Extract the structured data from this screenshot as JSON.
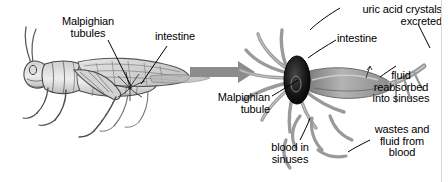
{
  "figure": {
    "background_color": "#ffffff",
    "text_color": "#000000",
    "ink_color": "#4a4a4a",
    "arrow_color": "#8c8c8c",
    "tubule_color": "#9a9a9a",
    "gut_color": "#1c1c1c"
  },
  "left_panel": {
    "name": "grasshopper-whole-body",
    "labels": [
      {
        "id": "malpighian-tubules",
        "text": "Malpighian\ntubules",
        "align": "center"
      },
      {
        "id": "intestine",
        "text": "intestine",
        "align": "left"
      }
    ]
  },
  "transition": {
    "name": "magnification-arrow",
    "direction": "right"
  },
  "right_panel": {
    "name": "malpighian-tubule-detail",
    "labels": [
      {
        "id": "uric-acid-crystals-excreted",
        "text": "uric acid crystals\nexcreted",
        "align": "right"
      },
      {
        "id": "intestine",
        "text": "intestine",
        "align": "left"
      },
      {
        "id": "fluid-reabsorbed-into-sinuses",
        "text": "fluid\nreabsorbed\ninto sinuses",
        "align": "center"
      },
      {
        "id": "malpighian-tubule",
        "text": "Malpighian\ntubule",
        "align": "right"
      },
      {
        "id": "blood-in-sinuses",
        "text": "blood in\nsinuses",
        "align": "center"
      },
      {
        "id": "wastes-and-fluid-from-blood",
        "text": "wastes and\nfluid from\nblood",
        "align": "center"
      }
    ]
  }
}
